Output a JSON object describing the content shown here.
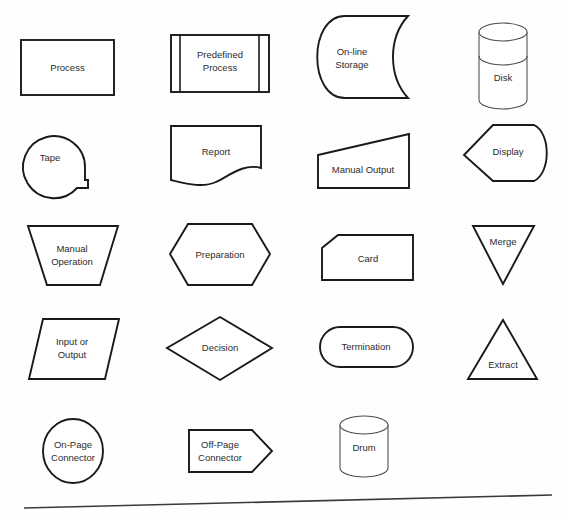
{
  "page": {
    "background_color": "#fefefe",
    "ink_color": "#1a1a1a",
    "width": 567,
    "height": 515,
    "rows": 5,
    "columns": 4,
    "baseline_rule": "horizontal rule across bottom of sheet"
  },
  "symbols": {
    "process": {
      "label": "Process",
      "shape": "rectangle"
    },
    "predefined_process": {
      "label_line1": "Predefined",
      "label_line2": "Process",
      "shape": "rectangle-with-double-side-bars"
    },
    "online_storage": {
      "label_line1": "On-line",
      "label_line2": "Storage",
      "shape": "online-storage"
    },
    "disk": {
      "label": "Disk",
      "shape": "cylinder-banded"
    },
    "tape": {
      "label": "Tape",
      "shape": "circle-with-tail"
    },
    "report": {
      "label": "Report",
      "shape": "document-wavy-bottom"
    },
    "manual_output": {
      "label": "Manual Output",
      "shape": "trapezoid-sloped-top"
    },
    "display": {
      "label": "Display",
      "shape": "display-pointed-left"
    },
    "manual_operation": {
      "label_line1": "Manual",
      "label_line2": "Operation",
      "shape": "inverted-trapezoid"
    },
    "preparation": {
      "label": "Preparation",
      "shape": "hexagon"
    },
    "card": {
      "label": "Card",
      "shape": "rectangle-clipped-corner"
    },
    "merge": {
      "label": "Merge",
      "shape": "triangle-down"
    },
    "input_or_output": {
      "label_line1": "Input or",
      "label_line2": "Output",
      "shape": "parallelogram"
    },
    "decision": {
      "label": "Decision",
      "shape": "diamond"
    },
    "termination": {
      "label": "Termination",
      "shape": "stadium"
    },
    "extract": {
      "label": "Extract",
      "shape": "triangle-up"
    },
    "on_page_connector": {
      "label_line1": "On-Page",
      "label_line2": "Connector",
      "shape": "circle"
    },
    "off_page_connector": {
      "label_line1": "Off-Page",
      "label_line2": "Connector",
      "shape": "pentagon-home-plate"
    },
    "drum": {
      "label": "Drum",
      "shape": "cylinder"
    }
  }
}
